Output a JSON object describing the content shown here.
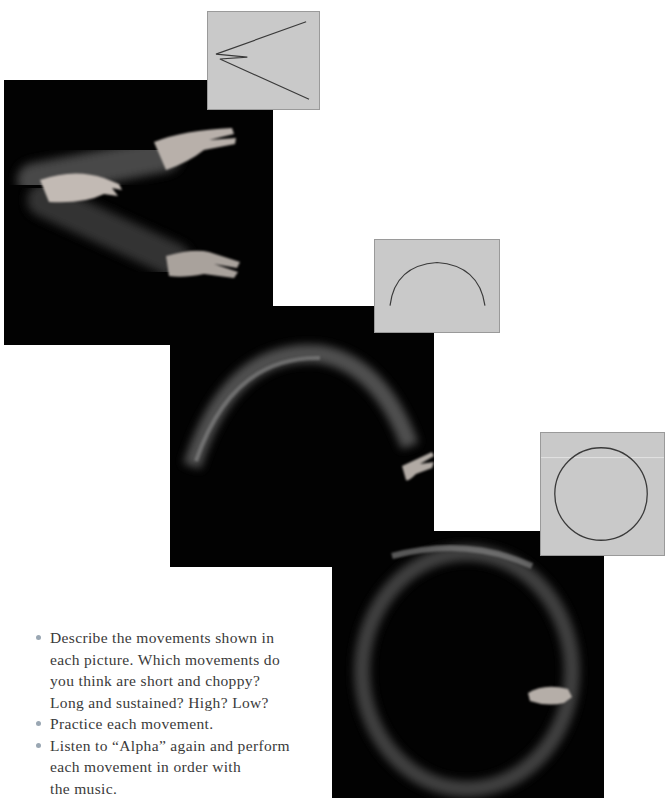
{
  "page": {
    "background": "#ffffff",
    "accent_bullet_color": "#9aa7b3"
  },
  "figures": [
    {
      "id": "zigzag",
      "photo_alt": "Hand motion blur tracing a sharp zig-zag path",
      "diagram_shape": "zigzag-icon",
      "diagram_background": "#c9c9c9"
    },
    {
      "id": "arc",
      "photo_alt": "Hand motion blur tracing a high arching curve",
      "diagram_shape": "arc-icon",
      "diagram_background": "#c9c9c9"
    },
    {
      "id": "circle",
      "photo_alt": "Hand motion blur tracing a full circle",
      "diagram_shape": "circle-icon",
      "diagram_background": "#c9c9c9"
    }
  ],
  "instructions": {
    "items": [
      {
        "lines": [
          "Describe the movements shown in",
          "each picture. Which movements do",
          "you think are short and choppy?",
          "Long and sustained? High? Low?"
        ]
      },
      {
        "lines": [
          "Practice each movement."
        ]
      },
      {
        "lines": [
          "Listen to “Alpha” again and perform",
          "each movement in order with",
          "the music."
        ]
      }
    ]
  }
}
